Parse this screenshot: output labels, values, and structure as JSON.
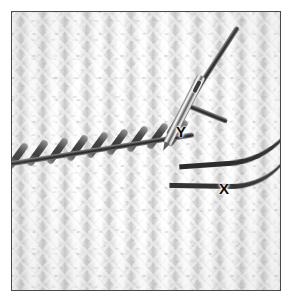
{
  "figure": {
    "kind": "instructional-photograph",
    "border_color": "#4a4a4a",
    "background_color": "#ffffff",
    "fabric_color": "#f8f8f8",
    "yarn_color": "#2b2b2b",
    "needle_color": "#c9c9c9"
  },
  "labels": {
    "x": "X",
    "y": "Y"
  },
  "annotations": [
    {
      "name": "label-x",
      "text": "X",
      "x": 207,
      "y": 169
    },
    {
      "name": "label-y",
      "text": "Y",
      "x": 164,
      "y": 112
    }
  ]
}
